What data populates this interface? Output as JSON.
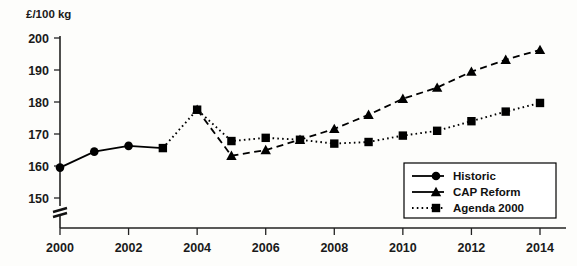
{
  "chart_data": {
    "type": "line",
    "title": "",
    "subtitle": "",
    "xlabel": "",
    "ylabel": "£/100 kg",
    "ylim": [
      145,
      200
    ],
    "xlim": [
      1999.5,
      2014.5
    ],
    "y_ticks": [
      150,
      160,
      170,
      180,
      190,
      200
    ],
    "x_ticks": [
      2000,
      2002,
      2004,
      2006,
      2008,
      2010,
      2012,
      2014
    ],
    "x_tick_labels": [
      "2000",
      "2002",
      "2004",
      "2006",
      "2008",
      "2010",
      "2012",
      "2014"
    ],
    "y_tick_labels": [
      "150",
      "160",
      "170",
      "180",
      "190",
      "200"
    ],
    "grid": false,
    "axis_break": true,
    "legend_position": "bottom-right",
    "x": [
      2000,
      2001,
      2002,
      2003,
      2004,
      2005,
      2006,
      2007,
      2008,
      2009,
      2010,
      2011,
      2012,
      2013,
      2014
    ],
    "series": [
      {
        "name": "Historic",
        "marker": "circle",
        "line_style": "solid",
        "color": "#000000",
        "x": [
          2000,
          2001,
          2002
        ],
        "values": [
          159.5,
          164.5,
          166.3
        ]
      },
      {
        "name": "CAP Reform",
        "marker": "triangle",
        "line_style": "dashed",
        "color": "#000000",
        "x": [
          2004,
          2005,
          2006,
          2007,
          2008,
          2009,
          2010,
          2011,
          2012,
          2013,
          2014
        ],
        "values": [
          177.6,
          163.2,
          165.0,
          168.2,
          171.6,
          176.0,
          181.0,
          184.5,
          189.5,
          193.2,
          196.3
        ]
      },
      {
        "name": "Agenda 2000",
        "marker": "square",
        "line_style": "dotted",
        "color": "#000000",
        "x": [
          2003,
          2004,
          2005,
          2006,
          2007,
          2008,
          2009,
          2010,
          2011,
          2012,
          2013,
          2014
        ],
        "values": [
          165.6,
          177.6,
          167.8,
          168.8,
          168.2,
          167.0,
          167.5,
          169.5,
          171.0,
          174.0,
          177.0,
          179.7
        ]
      }
    ],
    "connector_segments": [
      {
        "from": {
          "x": 2002,
          "y": 166.3
        },
        "to": {
          "x": 2003,
          "y": 165.6
        },
        "style": "solid"
      }
    ]
  },
  "legend": {
    "entries": [
      {
        "label": "Historic",
        "marker": "circle",
        "line_style": "solid"
      },
      {
        "label": "CAP Reform",
        "marker": "triangle",
        "line_style": "solid"
      },
      {
        "label": "Agenda 2000",
        "marker": "square",
        "line_style": "dotted"
      }
    ]
  }
}
